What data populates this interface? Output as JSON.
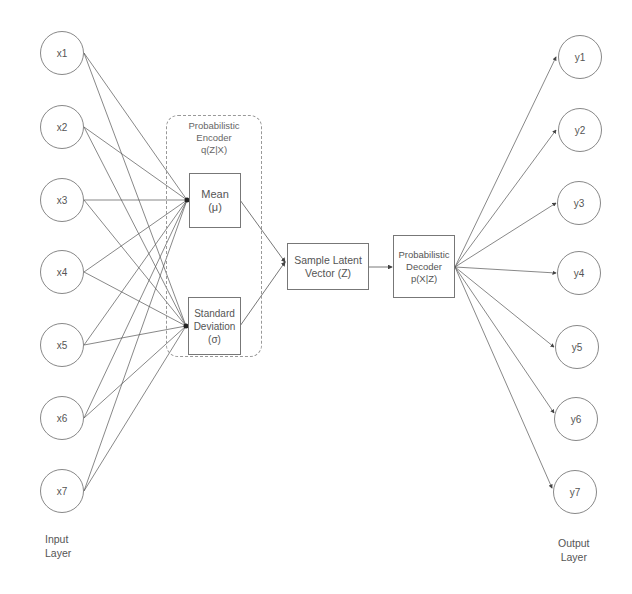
{
  "input_layer": {
    "label": "Input\nLayer",
    "nodes": [
      "x1",
      "x2",
      "x3",
      "x4",
      "x5",
      "x6",
      "x7"
    ]
  },
  "encoder": {
    "title": "Probabilistic\nEncoder\nq(Z|X)",
    "mean_label": "Mean\n(μ)",
    "std_label": "Standard\nDeviation\n(σ)"
  },
  "latent": {
    "label": "Sample Latent\nVector (Z)"
  },
  "decoder": {
    "label": "Probabilistic\nDecoder\np(X|Z)"
  },
  "output_layer": {
    "label": "Output\nLayer",
    "nodes": [
      "y1",
      "y2",
      "y3",
      "y4",
      "y5",
      "y6",
      "y7"
    ]
  },
  "colors": {
    "line": "#555555",
    "node_border": "#888888",
    "background": "#ffffff"
  }
}
